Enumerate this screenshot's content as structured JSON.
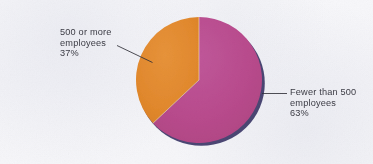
{
  "chart_data": {
    "type": "pie",
    "title": "",
    "subtitle": "",
    "xlabel": "",
    "ylabel": "",
    "legend_position": "none",
    "grid": false,
    "units": "percent",
    "categories": [
      "Fewer than 500 employees",
      "500 or more employees"
    ],
    "values": [
      63,
      37
    ],
    "slices": [
      {
        "label_line1": "Fewer than 500",
        "label_line2": "employees",
        "value_label": "63%",
        "value": 63,
        "color": "#b94b8d",
        "start_angle_deg": 0,
        "end_angle_deg": 226.8,
        "leader_line": true,
        "label_side": "right"
      },
      {
        "label_line1": "500 or more",
        "label_line2": "employees",
        "value_label": "37%",
        "value": 37,
        "color": "#e2892d",
        "start_angle_deg": 226.8,
        "end_angle_deg": 360,
        "leader_line": true,
        "label_side": "left"
      }
    ],
    "annotations": [
      "500 or more employees 37%",
      "Fewer than 500 employees 63%"
    ]
  },
  "colors": {
    "slice_magenta": "#b94b8d",
    "slice_orange": "#e2892d",
    "pie_shadow": "#3c3868",
    "label_text": "#3b3b44",
    "leader_line": "#2f2f38",
    "background": "#f6f6f9"
  },
  "labels": {
    "left": {
      "line1": "500 or more",
      "line2": "employees",
      "line3": "37%"
    },
    "right": {
      "line1": "Fewer than 500",
      "line2": "employees",
      "line3": "63%"
    }
  }
}
